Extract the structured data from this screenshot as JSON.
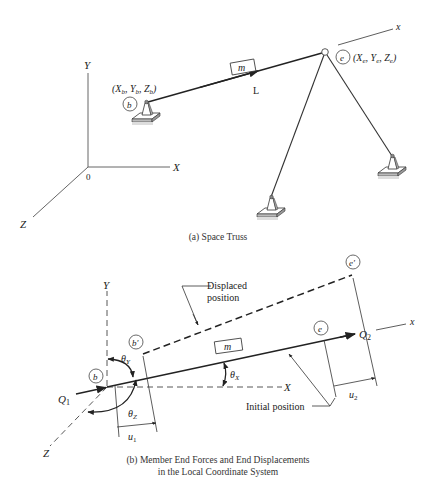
{
  "figure_a": {
    "caption": "(a) Space Truss",
    "global_axes": {
      "y_label": "Y",
      "x_label": "X",
      "z_label": "Z",
      "origin_label": "0"
    },
    "member_label": "m",
    "member_direction_label": "L",
    "local_axis_label": "x",
    "begin_joint": {
      "label": "b",
      "coords_label": "(Xb, Yb, Zb)",
      "X": "X",
      "Y": "Y",
      "Z": "Z",
      "sub": "b"
    },
    "end_joint": {
      "label": "e",
      "coords_label": "(Xe, Ye, Ze)",
      "X": "X",
      "Y": "Y",
      "Z": "Z",
      "sub": "e"
    }
  },
  "figure_b": {
    "caption_line1": "(b) Member End Forces and End Displacements",
    "caption_line2": "in the Local Coordinate System",
    "global_axes": {
      "y_label": "Y",
      "x_label": "X",
      "z_label": "Z"
    },
    "local_axis_label": "x",
    "member_label": "m",
    "begin_joint_label": "b",
    "begin_joint_displaced_label": "b′",
    "end_joint_label": "e",
    "end_joint_displaced_label": "e′",
    "force_begin": {
      "symbol": "Q",
      "sub": "1"
    },
    "force_end": {
      "symbol": "Q",
      "sub": "2"
    },
    "disp_begin": {
      "symbol": "u",
      "sub": "1"
    },
    "disp_end": {
      "symbol": "u",
      "sub": "2"
    },
    "angle_x": {
      "symbol": "θ",
      "sub": "X"
    },
    "angle_y": {
      "symbol": "θ",
      "sub": "Y"
    },
    "angle_z": {
      "symbol": "θ",
      "sub": "Z"
    },
    "annotation_displaced_line1": "Displaced",
    "annotation_displaced_line2": "position",
    "annotation_initial": "Initial position"
  }
}
